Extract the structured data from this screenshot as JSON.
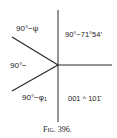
{
  "figure": {
    "caption": "Fig. 396.",
    "labels": {
      "upper_left": "90°−ψ",
      "left": "90°−",
      "lower_left": "90°−φ₁",
      "upper_right": "90°−71°54′",
      "lower_right": "001 ^ 101̄"
    },
    "line_color": "#2a2a2a"
  }
}
